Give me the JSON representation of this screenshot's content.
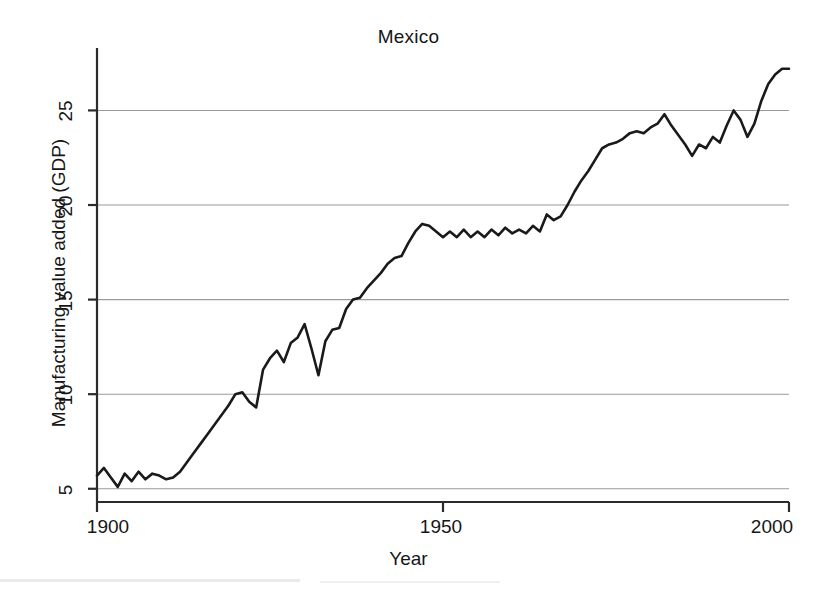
{
  "chart_data": {
    "type": "line",
    "title": "Mexico",
    "xlabel": "Year",
    "ylabel": "Manufacturing value added (GDP)",
    "xlim": [
      1900,
      2000
    ],
    "ylim": [
      4.3,
      28.3
    ],
    "xticks": [
      1900,
      1950,
      2000
    ],
    "xtick_labels": [
      "1900",
      "1950",
      "2000"
    ],
    "yticks": [
      5,
      10,
      15,
      20,
      25
    ],
    "ytick_labels": [
      "5",
      "10",
      "15",
      "20",
      "25"
    ],
    "grid": "horizontal",
    "legend": "none",
    "line_color": "#1a1a1a",
    "series": [
      {
        "name": "Manufacturing value added (GDP)",
        "x": [
          1900,
          1901,
          1902,
          1903,
          1904,
          1905,
          1906,
          1907,
          1908,
          1909,
          1910,
          1911,
          1912,
          1913,
          1914,
          1915,
          1916,
          1917,
          1918,
          1919,
          1920,
          1921,
          1922,
          1923,
          1924,
          1925,
          1926,
          1927,
          1928,
          1929,
          1930,
          1931,
          1932,
          1933,
          1934,
          1935,
          1936,
          1937,
          1938,
          1939,
          1940,
          1941,
          1942,
          1943,
          1944,
          1945,
          1946,
          1947,
          1948,
          1949,
          1950,
          1951,
          1952,
          1953,
          1954,
          1955,
          1956,
          1957,
          1958,
          1959,
          1960,
          1961,
          1962,
          1963,
          1964,
          1965,
          1966,
          1967,
          1968,
          1969,
          1970,
          1971,
          1972,
          1973,
          1974,
          1975,
          1976,
          1977,
          1978,
          1979,
          1980,
          1981,
          1982,
          1983,
          1984,
          1985,
          1986,
          1987,
          1988,
          1989,
          1990,
          1991,
          1992,
          1993,
          1994,
          1995,
          1996,
          1997,
          1998,
          1999,
          2000
        ],
        "values": [
          5.7,
          6.1,
          5.6,
          5.1,
          5.8,
          5.4,
          5.9,
          5.5,
          5.8,
          5.7,
          5.5,
          5.6,
          5.9,
          6.4,
          6.9,
          7.4,
          7.9,
          8.4,
          8.9,
          9.4,
          10.0,
          10.1,
          9.6,
          9.3,
          11.3,
          11.9,
          12.3,
          11.7,
          12.7,
          13.0,
          13.7,
          12.4,
          11.0,
          12.8,
          13.4,
          13.5,
          14.5,
          15.0,
          15.1,
          15.6,
          16.0,
          16.4,
          16.9,
          17.2,
          17.3,
          18.0,
          18.6,
          19.0,
          18.9,
          18.6,
          18.3,
          18.6,
          18.3,
          18.7,
          18.3,
          18.6,
          18.3,
          18.7,
          18.4,
          18.8,
          18.5,
          18.7,
          18.5,
          18.9,
          18.6,
          19.5,
          19.2,
          19.4,
          20.0,
          20.7,
          21.3,
          21.8,
          22.4,
          23.0,
          23.2,
          23.3,
          23.5,
          23.8,
          23.9,
          23.8,
          24.1,
          24.3,
          24.8,
          24.2,
          23.7,
          23.2,
          22.6,
          23.2,
          23.0,
          23.6,
          23.3,
          24.2,
          25.0,
          24.5,
          23.6,
          24.3,
          25.5,
          26.4,
          26.9,
          27.2,
          27.2
        ]
      }
    ]
  },
  "axes": {
    "y_ticks": [
      {
        "label": "25"
      },
      {
        "label": "20"
      },
      {
        "label": "15"
      },
      {
        "label": "10"
      },
      {
        "label": "5"
      }
    ],
    "x_ticks": [
      {
        "label": "1900"
      },
      {
        "label": "1950"
      },
      {
        "label": "2000"
      }
    ]
  }
}
